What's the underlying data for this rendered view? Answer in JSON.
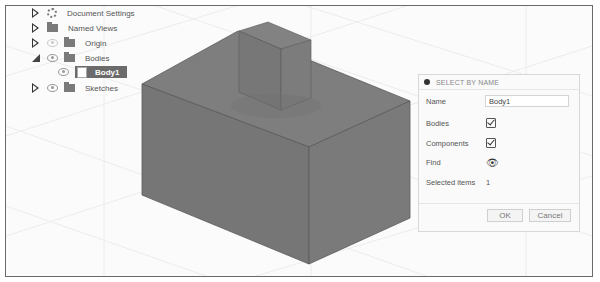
{
  "browser": {
    "items": [
      {
        "label": "Document Settings",
        "icon": "gear-icon",
        "expander": "collapsed",
        "visibility": false
      },
      {
        "label": "Named Views",
        "icon": "folder-icon",
        "expander": "collapsed",
        "visibility": false
      },
      {
        "label": "Origin",
        "icon": "folder-icon",
        "expander": "collapsed",
        "visibility": true
      },
      {
        "label": "Bodies",
        "icon": "folder-icon",
        "expander": "expanded",
        "visibility": true
      },
      {
        "label": "Body1",
        "icon": "body-icon",
        "selected": true,
        "visibility": true
      },
      {
        "label": "Sketches",
        "icon": "folder-icon",
        "expander": "collapsed",
        "visibility": true
      }
    ]
  },
  "dialog": {
    "title": "SELECT BY NAME",
    "name_label": "Name",
    "name_value": "Body1",
    "bodies_label": "Bodies",
    "bodies_checked": true,
    "components_label": "Components",
    "components_checked": true,
    "find_label": "Find",
    "find_icon": "binoculars-icon",
    "selected_label": "Selected items",
    "selected_count": "1",
    "ok_label": "OK",
    "cancel_label": "Cancel"
  },
  "viewport": {
    "model_color": "#7b7b7b"
  }
}
